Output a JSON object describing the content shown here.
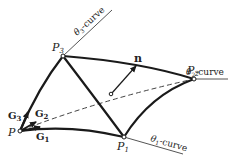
{
  "diagram": {
    "points": {
      "P": {
        "label": "P"
      },
      "P1": {
        "label": "P",
        "sub": "1"
      },
      "P2": {
        "label": "P",
        "sub": "2"
      },
      "P3": {
        "label": "P",
        "sub": "3"
      }
    },
    "curves": {
      "theta1": {
        "symbol": "θ",
        "sub": "1",
        "suffix": "-curve"
      },
      "theta2": {
        "symbol": "θ",
        "sub": "2",
        "suffix": "-curve"
      },
      "theta3": {
        "symbol": "θ",
        "sub": "3",
        "suffix": "-curve"
      }
    },
    "vectors": {
      "G1": {
        "label": "G",
        "sub": "1"
      },
      "G2": {
        "label": "G",
        "sub": "2"
      },
      "G3": {
        "label": "G",
        "sub": "3"
      },
      "n": {
        "label": "n"
      }
    },
    "colors": {
      "stroke": "#1a1a1a",
      "thin": "#444444",
      "background": "#ffffff"
    }
  }
}
